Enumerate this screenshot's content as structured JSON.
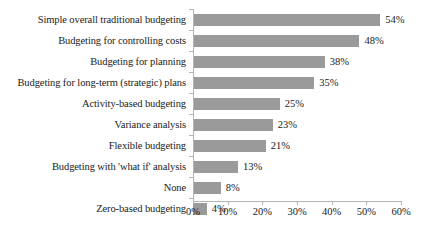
{
  "chart_data": {
    "type": "bar",
    "orientation": "horizontal",
    "title": "",
    "subtitle": "",
    "xlabel": "",
    "ylabel": "",
    "xlim": [
      0,
      60
    ],
    "grid": false,
    "legend": false,
    "legend_position": "none",
    "bar_color": "#9a9a9a",
    "axis_color": "#b4b4b4",
    "text_color": "#1a1a1a",
    "background": "#ffffff",
    "value_suffix": "%",
    "xticks": [
      0,
      10,
      20,
      30,
      40,
      50,
      60
    ],
    "xtick_labels": [
      "0%",
      "10%",
      "20%",
      "30%",
      "40%",
      "50%",
      "60%"
    ],
    "categories": [
      "Simple overall traditional budgeting",
      "Budgeting for controlling costs",
      "Budgeting for planning",
      "Budgeting for long-term (strategic) plans",
      "Activity-based budgeting",
      "Variance analysis",
      "Flexible budgeting",
      "Budgeting with 'what if' analysis",
      "None",
      "Zero-based budgeting"
    ],
    "values": [
      54,
      48,
      38,
      35,
      25,
      23,
      21,
      13,
      8,
      4
    ],
    "data_labels": [
      "54%",
      "48%",
      "38%",
      "35%",
      "25%",
      "23%",
      "21%",
      "13%",
      "8%",
      "4%"
    ]
  }
}
